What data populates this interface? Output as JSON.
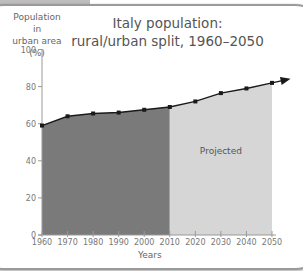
{
  "chart_data": {
    "type": "area",
    "title": "Italy population: rural/urban split, 1960–2050",
    "title_lines": [
      "Italy population:",
      "rural/urban split, 1960–2050"
    ],
    "xlabel": "Years",
    "ylabel": "Population in urban area (%)",
    "ylabel_lines": [
      "Population in",
      "urban area (%)"
    ],
    "x": [
      1960,
      1970,
      1980,
      1990,
      2000,
      2010,
      2020,
      2030,
      2040,
      2050
    ],
    "values": [
      59,
      64,
      65.5,
      66,
      67.5,
      69,
      72,
      76.5,
      79,
      82
    ],
    "ylim": [
      0,
      100
    ],
    "xlim": [
      1960,
      2050
    ],
    "yticks": [
      0,
      20,
      40,
      60,
      80,
      100
    ],
    "xticks": [
      1960,
      1970,
      1980,
      1990,
      2000,
      2010,
      2020,
      2030,
      2040,
      2050
    ],
    "regions": [
      {
        "name": "Historical",
        "from": 1960,
        "to": 2010,
        "color": "#7a7a7a"
      },
      {
        "name": "Projected",
        "from": 2010,
        "to": 2050,
        "color": "#d6d6d6",
        "label": "Projected"
      }
    ],
    "annotations": [
      "Projected"
    ],
    "grid": false,
    "trend_arrow": true
  },
  "colors": {
    "historical_fill": "#7a7a7a",
    "projected_fill": "#d6d6d6",
    "line": "#1a1a1a",
    "axis": "#999999",
    "text": "#666666"
  }
}
